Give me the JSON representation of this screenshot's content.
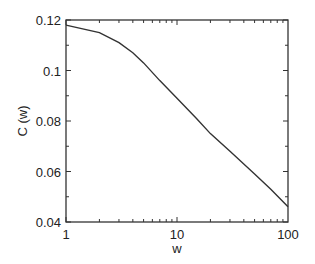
{
  "chart_data": {
    "type": "line",
    "title": "",
    "xlabel": "w",
    "ylabel": "C (w)",
    "xscale": "log",
    "xlim": [
      1,
      100
    ],
    "ylim": [
      0.04,
      0.12
    ],
    "grid": false,
    "legend": null,
    "x_ticks": [
      "1",
      "10",
      "100"
    ],
    "y_ticks": [
      "0.04",
      "0.06",
      "0.08",
      "0.1",
      "0.12"
    ],
    "series": [
      {
        "name": "C(w)",
        "color": "#333333",
        "x": [
          1,
          2,
          3,
          4,
          5,
          7,
          10,
          15,
          20,
          30,
          50,
          70,
          100
        ],
        "y": [
          0.118,
          0.115,
          0.111,
          0.107,
          0.103,
          0.096,
          0.089,
          0.081,
          0.075,
          0.068,
          0.059,
          0.053,
          0.046
        ]
      }
    ]
  }
}
